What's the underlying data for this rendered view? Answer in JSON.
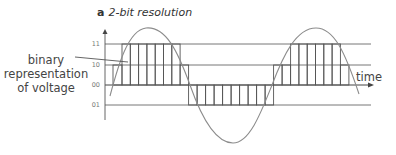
{
  "title": {
    "tag": "a",
    "text": "2-bit resolution"
  },
  "annotation": {
    "line1": "binary",
    "line2": "representation",
    "line3": "of voltage"
  },
  "x_axis_label": "time",
  "levels": [
    {
      "code": "11",
      "y": 44
    },
    {
      "code": "10",
      "y": 65
    },
    {
      "code": "00",
      "y": 85
    },
    {
      "code": "01",
      "y": 105
    }
  ],
  "colors": {
    "lines": "#555555",
    "wave": "#8a8a8a",
    "text": "#444444"
  }
}
